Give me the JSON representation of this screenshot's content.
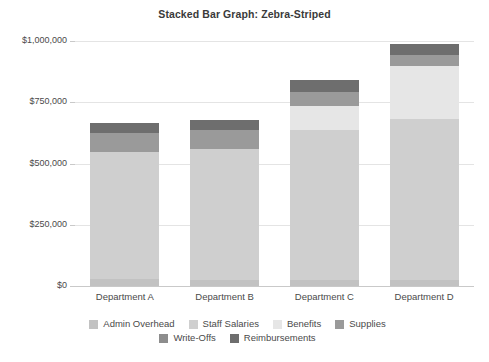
{
  "chart_data": {
    "type": "bar",
    "subtype": "stacked",
    "title": "Stacked Bar Graph: Zebra-Striped",
    "xlabel": "",
    "ylabel": "",
    "categories": [
      "Department A",
      "Department B",
      "Department C",
      "Department D"
    ],
    "series": [
      {
        "name": "Admin Overhead",
        "color": "#c2c2c2",
        "values": [
          28000,
          26000,
          24000,
          25000
        ]
      },
      {
        "name": "Staff Salaries",
        "color": "#cfcfcf",
        "values": [
          520000,
          534000,
          612000,
          655000
        ]
      },
      {
        "name": "Benefits",
        "color": "#e6e6e6",
        "values": [
          0,
          0,
          98000,
          217000
        ]
      },
      {
        "name": "Supplies",
        "color": "#9a9a9a",
        "values": [
          76000,
          78000,
          57000,
          44000
        ]
      },
      {
        "name": "Write-Offs",
        "color": "#8d8d8d",
        "values": [
          0,
          0,
          0,
          0
        ]
      },
      {
        "name": "Reimbursements",
        "color": "#6e6e6e",
        "values": [
          41000,
          40000,
          49000,
          47000
        ]
      }
    ],
    "totals": [
      665000,
      678000,
      840000,
      988000
    ],
    "ylim": [
      0,
      1000000
    ],
    "yticks": [
      0,
      250000,
      500000,
      750000,
      1000000
    ],
    "ytick_labels": [
      "$0",
      "$250,000",
      "$500,000",
      "$750,000",
      "$1,000,000"
    ],
    "grid": true,
    "legend_position": "bottom",
    "legend_columns": 4,
    "background": "#ffffff",
    "gridline_color": "#e4e4e4",
    "axis_color": "#c9c9c9",
    "text_color": "#4a4a4a"
  }
}
